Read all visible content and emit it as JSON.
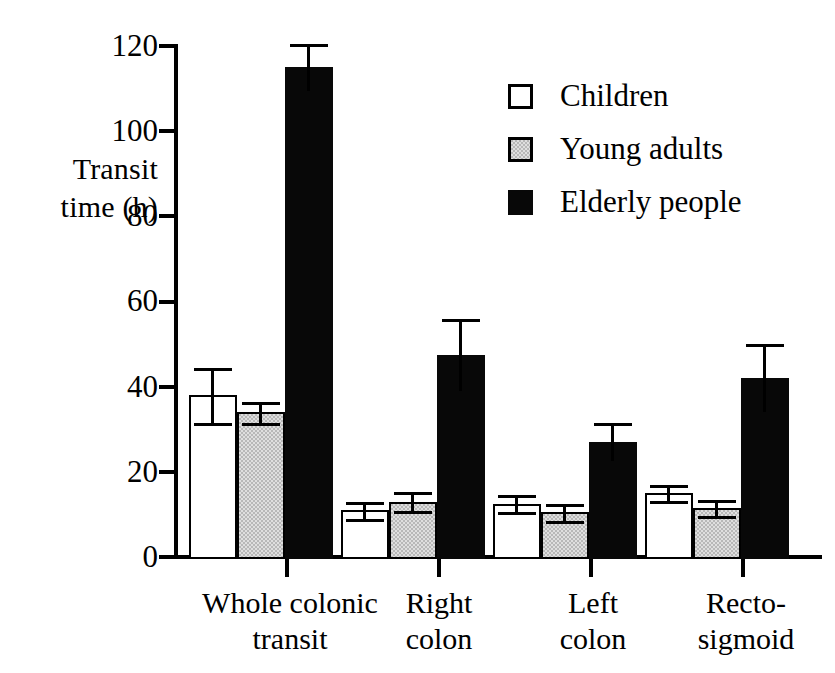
{
  "chart_data": {
    "type": "bar",
    "title": "",
    "xlabel": "",
    "ylabel": "Transit\ntime (h)",
    "ylim": [
      0,
      120
    ],
    "yticks": [
      0,
      20,
      40,
      60,
      80,
      100,
      120
    ],
    "ytick_labels": [
      "0",
      "20",
      "40",
      "60",
      "80",
      "100",
      "120"
    ],
    "grid": false,
    "legend_position": "upper right",
    "categories": [
      "Whole colonic\ntransit",
      "Right\ncolon",
      "Left\ncolon",
      "Recto-\nsigmoid"
    ],
    "series": [
      {
        "name": "Children",
        "color": "#ffffff",
        "edge_color": "#000000",
        "values": [
          38,
          11,
          12.5,
          15
        ],
        "errors": [
          6.5,
          2,
          2,
          1.8
        ]
      },
      {
        "name": "Young adults",
        "color": "#b8b8b8",
        "edge_color": "#000000",
        "values": [
          34,
          13,
          10.5,
          11.5
        ],
        "errors": [
          2.5,
          2.2,
          2,
          1.8
        ]
      },
      {
        "name": "Elderly people",
        "color": "#080808",
        "edge_color": "#080808",
        "values": [
          115,
          47.5,
          27,
          42
        ],
        "errors": [
          5.5,
          8.5,
          4.5,
          8
        ]
      }
    ]
  },
  "legend": {
    "items": [
      {
        "label": "Children",
        "swatch": "children"
      },
      {
        "label": "Young adults",
        "swatch": "young"
      },
      {
        "label": "Elderly people",
        "swatch": "elderly"
      }
    ]
  },
  "axis": {
    "y_title": "Transit\ntime (h)",
    "y_labels": [
      "120",
      "100",
      "80",
      "60",
      "40",
      "20",
      "0"
    ],
    "x_labels": [
      "Whole colonic\ntransit",
      "Right\ncolon",
      "Left\ncolon",
      "Recto-\nsigmoid"
    ]
  }
}
